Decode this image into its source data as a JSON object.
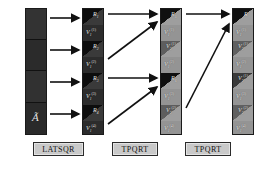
{
  "figure": {
    "background": "#ffffff",
    "width": 263,
    "height": 170
  },
  "palette": {
    "dark_block": "#2e2e2e",
    "dark_block_alt": "#242424",
    "light_block": "#9a9a9a",
    "light_block_alt": "#8e8e8e",
    "triangle_dark": "#111111",
    "label_text": "#e8e8e8",
    "box_fill": "#c9c9c9",
    "box_border": "#2b2b2b",
    "arrow": "#111111"
  },
  "columns": [
    {
      "id": "col-a",
      "name": "input-matrix",
      "shade": "dark",
      "label": "Ã",
      "segments": [
        {
          "label": ""
        },
        {
          "label": ""
        },
        {
          "label": ""
        },
        {
          "label": "Ã"
        }
      ]
    },
    {
      "id": "col-1",
      "name": "latsqr-output",
      "shade": "dark",
      "segments": [
        {
          "kind": "triangle",
          "label": "R",
          "sub": "1",
          "sup": ""
        },
        {
          "kind": "panel",
          "label": "V",
          "sub": "1",
          "sup": "(1)"
        },
        {
          "kind": "triangle",
          "label": "R",
          "sub": "2",
          "sup": ""
        },
        {
          "kind": "panel",
          "label": "V",
          "sub": "1",
          "sup": "(2)"
        },
        {
          "kind": "triangle",
          "label": "R",
          "sub": "3",
          "sup": ""
        },
        {
          "kind": "panel",
          "label": "V",
          "sub": "1",
          "sup": "(3)"
        },
        {
          "kind": "triangle",
          "label": "R",
          "sub": "4",
          "sup": ""
        },
        {
          "kind": "panel",
          "label": "V",
          "sub": "1",
          "sup": "(4)"
        }
      ]
    },
    {
      "id": "col-2",
      "name": "tpqrt-level-1-output",
      "shade": "light",
      "segments": [
        {
          "kind": "triangle",
          "label": "R",
          "sub": "5",
          "sup": ""
        },
        {
          "kind": "panel",
          "label": "V",
          "sub": "1",
          "sup": "(1)"
        },
        {
          "kind": "triangle",
          "label": "V",
          "sub": "2",
          "sup": "(1)"
        },
        {
          "kind": "panel",
          "label": "V",
          "sub": "1",
          "sup": "(2)"
        },
        {
          "kind": "triangle",
          "label": "R",
          "sub": "6",
          "sup": ""
        },
        {
          "kind": "panel",
          "label": "V",
          "sub": "1",
          "sup": "(3)"
        },
        {
          "kind": "triangle",
          "label": "V",
          "sub": "2",
          "sup": "(2)"
        },
        {
          "kind": "panel",
          "label": "V",
          "sub": "1",
          "sup": "(4)"
        }
      ]
    },
    {
      "id": "col-3",
      "name": "tpqrt-level-2-output",
      "shade": "light",
      "segments": [
        {
          "kind": "triangle",
          "label": "R",
          "sub": "",
          "sup": ""
        },
        {
          "kind": "panel",
          "label": "V",
          "sub": "1",
          "sup": "(1)"
        },
        {
          "kind": "triangle",
          "label": "V",
          "sub": "2",
          "sup": "(1)"
        },
        {
          "kind": "panel",
          "label": "V",
          "sub": "1",
          "sup": "(2)"
        },
        {
          "kind": "triangle",
          "label": "V",
          "sub": "3",
          "sup": "(1)"
        },
        {
          "kind": "panel",
          "label": "V",
          "sub": "1",
          "sup": "(3)"
        },
        {
          "kind": "triangle",
          "label": "V",
          "sub": "2",
          "sup": "(2)"
        },
        {
          "kind": "panel",
          "label": "V",
          "sub": "1",
          "sup": "(4)"
        }
      ]
    }
  ],
  "routine_boxes": [
    {
      "id": "box-latsqr",
      "name": "latsqr",
      "label": "LATSQR"
    },
    {
      "id": "box-tpqrt-1",
      "name": "tpqrt-1",
      "label": "TPQRT"
    },
    {
      "id": "box-tpqrt-2",
      "name": "tpqrt-2",
      "label": "TPQRT"
    }
  ],
  "arrows": [
    {
      "name": "arrow-a-to-1-row1",
      "kind": "horizontal"
    },
    {
      "name": "arrow-a-to-1-row2",
      "kind": "horizontal"
    },
    {
      "name": "arrow-a-to-1-row3",
      "kind": "horizontal"
    },
    {
      "name": "arrow-a-to-1-row4",
      "kind": "horizontal"
    },
    {
      "name": "arrow-1-to-2-top-horizontal",
      "kind": "horizontal"
    },
    {
      "name": "arrow-1-to-2-top-diagonal",
      "kind": "diagonal"
    },
    {
      "name": "arrow-1-to-2-bottom-horizontal",
      "kind": "horizontal"
    },
    {
      "name": "arrow-1-to-2-bottom-diagonal",
      "kind": "diagonal"
    },
    {
      "name": "arrow-2-to-3-horizontal",
      "kind": "horizontal"
    },
    {
      "name": "arrow-2-to-3-diagonal",
      "kind": "diagonal"
    }
  ]
}
